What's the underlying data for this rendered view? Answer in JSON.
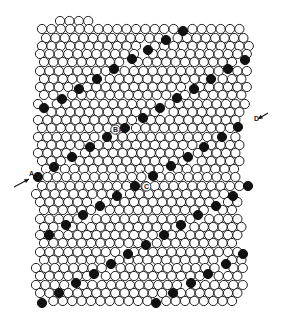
{
  "figure": {
    "type": "hexagonal close-packed circle lattice (bubble raft) with a dislocation",
    "background": "#ffffff",
    "circle_fill": "#ffffff",
    "circle_stroke": "#222222",
    "marked_fill": "#111111",
    "circle_radius": 4.6,
    "spacing_x": 9.4,
    "spacing_y": 8.3,
    "rows": [
      {
        "y": 21,
        "x0": 60,
        "n": 4
      },
      {
        "y": 29,
        "x0": 42,
        "n": 22
      },
      {
        "y": 38,
        "x0": 46,
        "n": 22
      },
      {
        "y": 46,
        "x0": 42,
        "n": 23
      },
      {
        "y": 54,
        "x0": 40,
        "n": 23
      },
      {
        "y": 62,
        "x0": 44,
        "n": 22
      },
      {
        "y": 71,
        "x0": 40,
        "n": 23
      },
      {
        "y": 79,
        "x0": 44,
        "n": 22
      },
      {
        "y": 87,
        "x0": 40,
        "n": 23
      },
      {
        "y": 95,
        "x0": 44,
        "n": 22
      },
      {
        "y": 104,
        "x0": 38,
        "n": 23
      },
      {
        "y": 112,
        "x0": 42,
        "n": 22
      },
      {
        "y": 120,
        "x0": 38,
        "n": 22
      },
      {
        "y": 128,
        "x0": 42,
        "n": 22
      },
      {
        "y": 137,
        "x0": 38,
        "n": 22
      },
      {
        "y": 145,
        "x0": 42,
        "n": 22
      },
      {
        "y": 153,
        "x0": 38,
        "n": 22
      },
      {
        "y": 161,
        "x0": 42,
        "n": 22
      },
      {
        "y": 169,
        "x0": 46,
        "n": 21
      },
      {
        "y": 177,
        "x0": 38,
        "n": 22
      },
      {
        "y": 186,
        "x0": 42,
        "n": 22
      },
      {
        "y": 194,
        "x0": 36,
        "n": 22
      },
      {
        "y": 202,
        "x0": 40,
        "n": 22
      },
      {
        "y": 210,
        "x0": 44,
        "n": 21
      },
      {
        "y": 219,
        "x0": 40,
        "n": 22
      },
      {
        "y": 227,
        "x0": 44,
        "n": 22
      },
      {
        "y": 235,
        "x0": 40,
        "n": 22
      },
      {
        "y": 243,
        "x0": 44,
        "n": 21
      },
      {
        "y": 252,
        "x0": 40,
        "n": 22
      },
      {
        "y": 260,
        "x0": 44,
        "n": 22
      },
      {
        "y": 268,
        "x0": 36,
        "n": 23
      },
      {
        "y": 276,
        "x0": 40,
        "n": 22
      },
      {
        "y": 285,
        "x0": 36,
        "n": 23
      },
      {
        "y": 293,
        "x0": 40,
        "n": 22
      },
      {
        "y": 301,
        "x0": 44,
        "n": 21
      }
    ],
    "marked_circles": [
      [
        183,
        31
      ],
      [
        166,
        40
      ],
      [
        148,
        50
      ],
      [
        132,
        59
      ],
      [
        114,
        69
      ],
      [
        97,
        79
      ],
      [
        79,
        89
      ],
      [
        62,
        99
      ],
      [
        44,
        108
      ],
      [
        245,
        60
      ],
      [
        228,
        69
      ],
      [
        211,
        79
      ],
      [
        194,
        89
      ],
      [
        177,
        98
      ],
      [
        160,
        108
      ],
      [
        143,
        118
      ],
      [
        125,
        128
      ],
      [
        107,
        137
      ],
      [
        90,
        147
      ],
      [
        72,
        157
      ],
      [
        54,
        167
      ],
      [
        38,
        177
      ],
      [
        238,
        127
      ],
      [
        222,
        137
      ],
      [
        204,
        147
      ],
      [
        188,
        157
      ],
      [
        171,
        166
      ],
      [
        153,
        176
      ],
      [
        135,
        186
      ],
      [
        117,
        196
      ],
      [
        100,
        206
      ],
      [
        83,
        215
      ],
      [
        66,
        225
      ],
      [
        49,
        235
      ],
      [
        248,
        186
      ],
      [
        233,
        196
      ],
      [
        216,
        206
      ],
      [
        198,
        215
      ],
      [
        181,
        225
      ],
      [
        164,
        235
      ],
      [
        146,
        245
      ],
      [
        128,
        254
      ],
      [
        111,
        264
      ],
      [
        94,
        274
      ],
      [
        76,
        283
      ],
      [
        59,
        293
      ],
      [
        42,
        303
      ],
      [
        243,
        254
      ],
      [
        226,
        264
      ],
      [
        208,
        274
      ],
      [
        191,
        283
      ],
      [
        173,
        293
      ],
      [
        156,
        303
      ]
    ],
    "labels": [
      {
        "id": "A",
        "text": "A",
        "x": 29,
        "y": 176
      },
      {
        "id": "B",
        "text": "B",
        "x": 113,
        "y": 132
      },
      {
        "id": "C",
        "text": "C",
        "x": 144,
        "y": 189
      },
      {
        "id": "D",
        "text": "D",
        "x": 254,
        "y": 121
      }
    ],
    "arrows": [
      {
        "id": "arrow-A",
        "from": [
          14,
          187
        ],
        "to": [
          29,
          179
        ]
      },
      {
        "id": "arrow-D",
        "from": [
          268,
          113
        ],
        "to": [
          258,
          119
        ]
      }
    ],
    "dislocation_dashes": [
      [
        [
          116,
          140
        ],
        [
          122,
          146
        ]
      ],
      [
        [
          136,
          156
        ],
        [
          140,
          160
        ]
      ],
      [
        [
          141,
          170
        ],
        [
          144,
          173
        ]
      ]
    ]
  }
}
